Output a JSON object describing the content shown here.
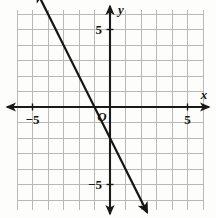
{
  "figure": {
    "name": "coordinate-plane-with-line",
    "width": 216,
    "height": 218,
    "background_color": "#fdfdfc"
  },
  "grid": {
    "color": "#b9b9bb",
    "cell_size": 15.5,
    "left": 17,
    "right": 203,
    "top": 10,
    "bottom": 210,
    "show": true
  },
  "axes": {
    "color": "#1a1a1a",
    "origin_px": {
      "x": 110,
      "y": 107
    },
    "x_label": "x",
    "y_label": "y",
    "origin_label": "O",
    "x_ticks": [
      {
        "value": -5,
        "label": "-5"
      },
      {
        "value": 5,
        "label": "5"
      }
    ],
    "y_ticks": [
      {
        "value": 5,
        "label": "5"
      },
      {
        "value": -5,
        "label": "-5"
      }
    ],
    "x_range": [
      -6,
      6
    ],
    "y_range": [
      -6.3,
      6.3
    ],
    "arrows": [
      "left",
      "right",
      "up",
      "down"
    ]
  },
  "chart_data": {
    "type": "line",
    "title": "",
    "xlabel": "x",
    "ylabel": "y",
    "xlim": [
      -6,
      6
    ],
    "ylim": [
      -6.3,
      6.3
    ],
    "grid": true,
    "legend": "none",
    "series": [
      {
        "name": "line",
        "equation": "y = -2x - 2",
        "slope": -2,
        "y_intercept": -2,
        "x_intercept": -1,
        "color": "#151515",
        "arrows": "both",
        "points": [
          {
            "x": -4.7,
            "y": 7.4
          },
          {
            "x": -1,
            "y": 0
          },
          {
            "x": 0,
            "y": -2
          },
          {
            "x": 2.4,
            "y": -6.8
          }
        ]
      }
    ]
  }
}
